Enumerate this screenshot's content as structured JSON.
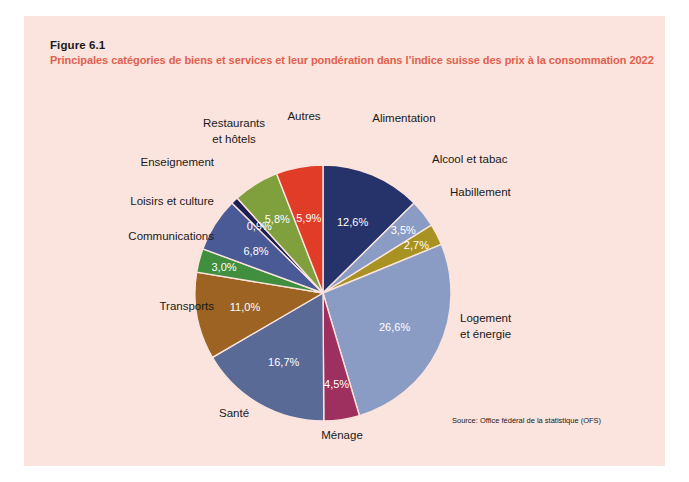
{
  "figure": {
    "number": "Figure 6.1",
    "title": "Principales catégories de biens et services et leur pondération dans l’indice suisse des prix à la consommation 2022",
    "source": "Source: Office fédéral de la statistique (OFS)",
    "background_color": "#fbe4dd",
    "title_color": "#e0604e"
  },
  "chart_data": {
    "type": "pie",
    "title": "Principales catégories de biens et services et leur pondération dans l’indice suisse des prix à la consommation 2022",
    "unit": "%",
    "decimal_separator": ",",
    "legend": "none",
    "grid": false,
    "start_angle_deg": 0,
    "direction": "clockwise",
    "categories": [
      "Alimentation",
      "Alcool et tabac",
      "Habillement",
      "Logement et énergie",
      "Ménage",
      "Santé",
      "Transports",
      "Communications",
      "Loisirs et culture",
      "Enseignement",
      "Restaurants et hôtels",
      "Autres"
    ],
    "values": [
      12.6,
      3.5,
      2.7,
      26.6,
      4.5,
      16.7,
      11.0,
      3.0,
      6.8,
      0.9,
      5.8,
      5.9
    ],
    "value_labels": [
      "12,6%",
      "3,5%",
      "2,7%",
      "26,6%",
      "4,5%",
      "16,7%",
      "11,0%",
      "3,0%",
      "6,8%",
      "0,9%",
      "5,8%",
      "5,9%"
    ],
    "colors": [
      "#26336b",
      "#8b9cc4",
      "#a89222",
      "#8b9cc4",
      "#9e3060",
      "#5a6a96",
      "#9c6322",
      "#3f8f3f",
      "#4a5a96",
      "#1b2050",
      "#7fa03c",
      "#e03c28"
    ],
    "slices": [
      {
        "label": "Alimentation",
        "value": 12.6,
        "value_label": "12,6%",
        "color": "#26336b",
        "label_fill": "#ffffff"
      },
      {
        "label": "Alcool et tabac",
        "value": 3.5,
        "value_label": "3,5%",
        "color": "#8b9cc4",
        "label_fill": "#ffffff"
      },
      {
        "label": "Habillement",
        "value": 2.7,
        "value_label": "2,7%",
        "color": "#a89222",
        "label_fill": "#ffffff"
      },
      {
        "label": "Logement et énergie",
        "value": 26.6,
        "value_label": "26,6%",
        "color": "#8b9cc4",
        "label_fill": "#ffffff"
      },
      {
        "label": "Ménage",
        "value": 4.5,
        "value_label": "4,5%",
        "color": "#9e3060",
        "label_fill": "#ffffff"
      },
      {
        "label": "Santé",
        "value": 16.7,
        "value_label": "16,7%",
        "color": "#5a6a96",
        "label_fill": "#ffffff"
      },
      {
        "label": "Transports",
        "value": 11.0,
        "value_label": "11,0%",
        "color": "#9c6322",
        "label_fill": "#ffffff"
      },
      {
        "label": "Communications",
        "value": 3.0,
        "value_label": "3,0%",
        "color": "#3f8f3f",
        "label_fill": "#ffffff"
      },
      {
        "label": "Loisirs et culture",
        "value": 6.8,
        "value_label": "6,8%",
        "color": "#4a5a96",
        "label_fill": "#ffffff"
      },
      {
        "label": "Enseignement",
        "value": 0.9,
        "value_label": "0,9%",
        "color": "#1b2050",
        "label_fill": "#ffffff"
      },
      {
        "label": "Restaurants et hôtels",
        "value": 5.8,
        "value_label": "5,8%",
        "color": "#7fa03c",
        "label_fill": "#ffffff"
      },
      {
        "label": "Autres",
        "value": 5.9,
        "value_label": "5,9%",
        "color": "#e03c28",
        "label_fill": "#ffffff"
      }
    ]
  },
  "callouts": {
    "alimentation": "Alimentation",
    "alcool_et_tabac": "Alcool et tabac",
    "habillement": "Habillement",
    "logement_line1": "Logement",
    "logement_line2": "et énergie",
    "menage": "Ménage",
    "sante": "Santé",
    "transports": "Transports",
    "communications": "Communications",
    "loisirs_et_culture": "Loisirs et culture",
    "enseignement": "Enseignement",
    "restaurants_line1": "Restaurants",
    "restaurants_line2": "et hôtels",
    "autres": "Autres"
  }
}
